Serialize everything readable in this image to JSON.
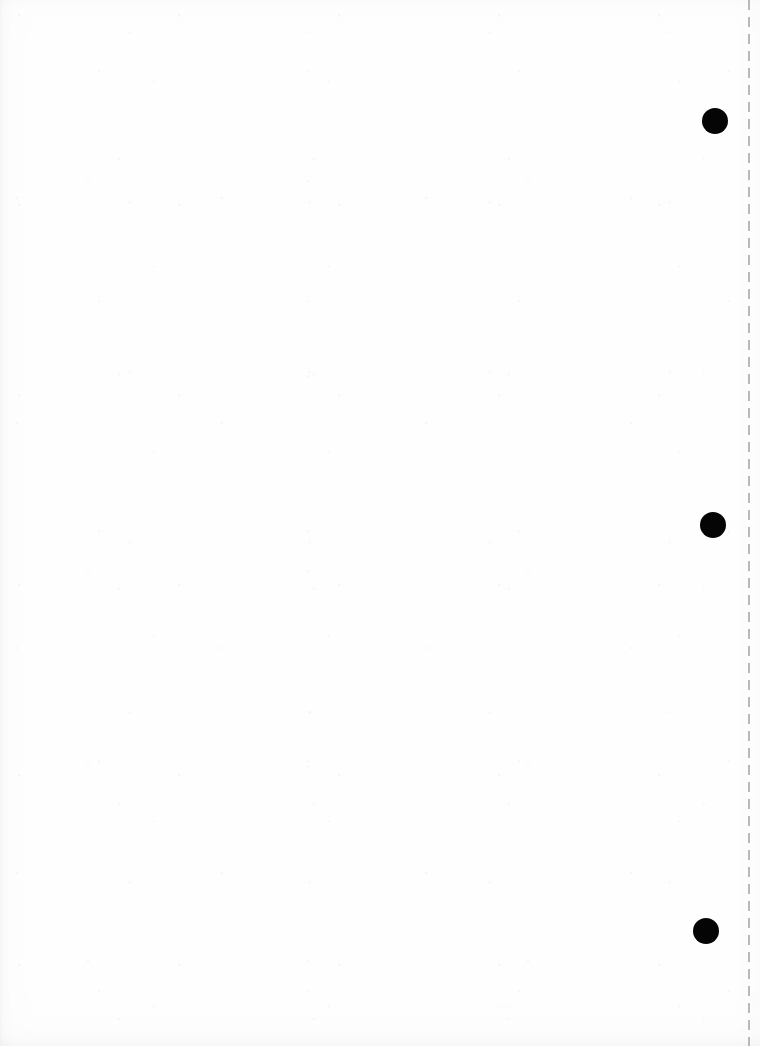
{
  "document": {
    "title": "Scanned blank page",
    "page_width": 760,
    "page_height": 1046,
    "background_color": "#fefefe",
    "orientation": "portrait",
    "content_text": "",
    "description": "Near-blank scanned document page with a vertical dashed guide line near the right edge and three solid black circular punch marks."
  },
  "guide_line": {
    "name": "vertical dashed crop line",
    "x": 748,
    "top": 0,
    "bottom": 1046,
    "color": "#b9b9b9",
    "thickness": 1.5,
    "dash_length": 10,
    "gap_length": 7,
    "style": "dashed"
  },
  "punch_marks": {
    "color": "#050505",
    "count": 3,
    "shape": "circle",
    "items": [
      {
        "id": "punch-mark-1",
        "cx": 715,
        "cy": 121,
        "diameter": 26
      },
      {
        "id": "punch-mark-2",
        "cx": 713,
        "cy": 525,
        "diameter": 26
      },
      {
        "id": "punch-mark-3",
        "cx": 706,
        "cy": 931,
        "diameter": 26
      }
    ]
  }
}
